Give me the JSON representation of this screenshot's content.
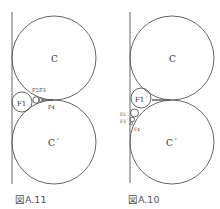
{
  "figures": [
    {
      "id": "left",
      "caption": "図A.11",
      "labels": {
        "C": "C",
        "C_prime": "C´",
        "F1": "F1",
        "F2": "F2",
        "F3": "F3",
        "F4": "F4"
      }
    },
    {
      "id": "right",
      "caption": "図A.10",
      "labels": {
        "C": "C",
        "C_prime": "C´",
        "F1": "F1´",
        "F2": "F2´",
        "F3": "F3´",
        "F4": "F4"
      }
    }
  ],
  "colors": {
    "stroke": "#555555",
    "text": "#333333",
    "background": "#ffffff"
  }
}
